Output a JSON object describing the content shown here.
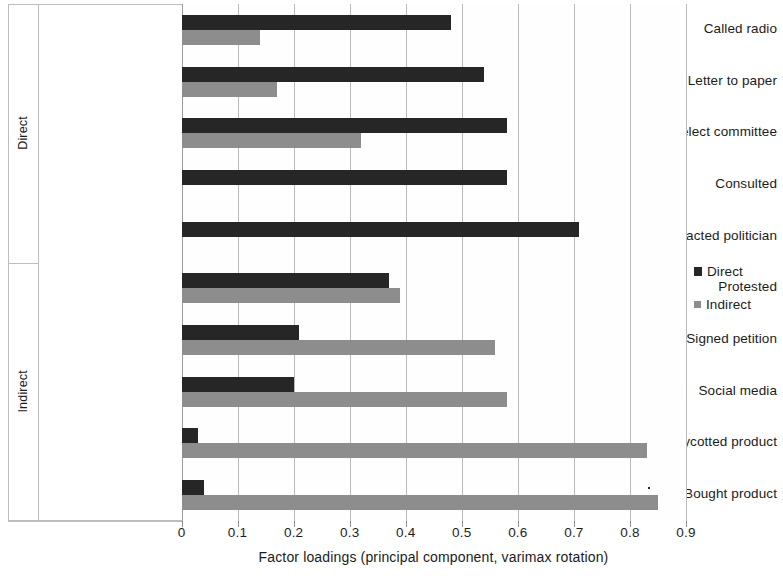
{
  "chart_data": {
    "type": "bar",
    "orientation": "horizontal",
    "title": "",
    "xlabel": "Factor loadings (principal component, varimax rotation)",
    "ylabel": "",
    "xlim": [
      0,
      0.9
    ],
    "xticks": [
      "0",
      "0.1",
      "0.2",
      "0.3",
      "0.4",
      "0.5",
      "0.6",
      "0.7",
      "0.8",
      "0.9"
    ],
    "xtick_values": [
      0,
      0.1,
      0.2,
      0.3,
      0.4,
      0.5,
      0.6,
      0.7,
      0.8,
      0.9
    ],
    "grid": true,
    "legend_position": "right",
    "categories": [
      "Called radio",
      "Letter to paper",
      "Select committee",
      "Consulted",
      "Contacted politician",
      "Protested",
      "Signed petition",
      "Social media",
      "Boycotted product",
      "Bought product"
    ],
    "groups": [
      {
        "label": "Direct",
        "categories": [
          "Called radio",
          "Letter to paper",
          "Select committee",
          "Consulted",
          "Contacted politician"
        ]
      },
      {
        "label": "Indirect",
        "categories": [
          "Protested",
          "Signed petition",
          "Social media",
          "Boycotted product",
          "Bought product"
        ]
      }
    ],
    "series": [
      {
        "name": "Direct",
        "color": "#262626",
        "values": [
          0.48,
          0.54,
          0.58,
          0.58,
          0.71,
          0.37,
          0.21,
          0.2,
          0.03,
          0.04
        ]
      },
      {
        "name": "Indirect",
        "color": "#8d8d8d",
        "values": [
          0.14,
          0.17,
          0.32,
          0.0,
          0.0,
          0.39,
          0.56,
          0.58,
          0.83,
          0.85
        ]
      }
    ]
  },
  "legend": {
    "items": [
      {
        "label": "Direct",
        "swatch": "direct-swatch-icon"
      },
      {
        "label": "Indirect",
        "swatch": "indirect-swatch-icon"
      }
    ]
  },
  "axis": {
    "x_title": "Factor loadings (principal component, varimax rotation)"
  }
}
